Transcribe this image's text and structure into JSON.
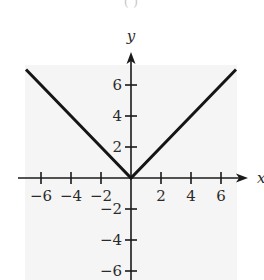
{
  "panel_label": "( )",
  "chart_data": {
    "type": "line",
    "title": "",
    "function": "y = |x|",
    "xlabel": "x",
    "ylabel": "y",
    "xlim": [
      -7,
      7
    ],
    "ylim": [
      -7,
      7
    ],
    "grid": false,
    "legend": null,
    "x_ticks": [
      -6,
      -4,
      -2,
      2,
      4,
      6
    ],
    "y_ticks": [
      -6,
      -4,
      -2,
      2,
      4,
      6
    ],
    "x_tick_labels": [
      "−6",
      "−4",
      "−2",
      "2",
      "4",
      "6"
    ],
    "y_tick_labels": [
      "−6",
      "−4",
      "−2",
      "2",
      "4",
      "6"
    ],
    "series": [
      {
        "name": "y = |x|",
        "x": [
          -7,
          -6,
          -4,
          -2,
          0,
          2,
          4,
          6,
          7
        ],
        "y": [
          7,
          6,
          4,
          2,
          0,
          2,
          4,
          6,
          7
        ]
      }
    ]
  },
  "style": {
    "background": "#ffffff",
    "plot_background": "#f5f5f5",
    "axis_color": "#1a1a1a",
    "line_color": "#151515"
  },
  "layout": {
    "origin": [
      131,
      178
    ],
    "x_scale": 15,
    "y_scale": 15.5,
    "plot_rect": [
      25,
      65,
      212,
      215
    ],
    "x_axis_range_px": [
      18,
      248
    ],
    "y_axis_range_px": [
      280,
      52
    ]
  }
}
